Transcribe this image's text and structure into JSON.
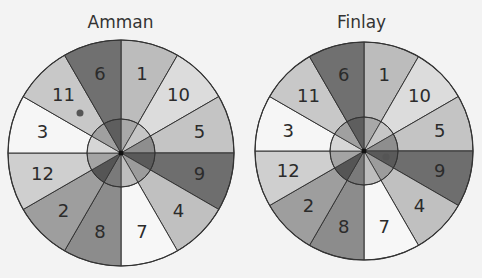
{
  "spinners": [
    {
      "name": "Amman",
      "center": [
        121,
        153
      ],
      "radius": 113,
      "inner_radius": 34,
      "dot": {
        "sector": "11",
        "x": 80,
        "y": 113
      }
    },
    {
      "name": "Finlay",
      "center": [
        364,
        151
      ],
      "radius": 109,
      "inner_radius": 34,
      "dot": {
        "sector": "9",
        "x": 386,
        "y": 157
      }
    }
  ],
  "sectors_clockwise_from_top": [
    {
      "label": "1",
      "color": "#bcbcbc",
      "inner": "#a8a8a8"
    },
    {
      "label": "10",
      "color": "#dcdcdc",
      "inner": "#c6c6c6"
    },
    {
      "label": "5",
      "color": "#c4c4c4",
      "inner": "#8e8e8e"
    },
    {
      "label": "9",
      "color": "#6e6e6e",
      "inner": "#5a5a5a"
    },
    {
      "label": "4",
      "color": "#c0c0c0",
      "inner": "#9c9c9c"
    },
    {
      "label": "7",
      "color": "#f7f7f7",
      "inner": "#bebebe"
    },
    {
      "label": "8",
      "color": "#8c8c8c",
      "inner": "#7a7a7a"
    },
    {
      "label": "2",
      "color": "#9e9e9e",
      "inner": "#555555"
    },
    {
      "label": "12",
      "color": "#cfcfcf",
      "inner": "#a4a4a4"
    },
    {
      "label": "3",
      "color": "#f6f6f6",
      "inner": "#d6d6d6"
    },
    {
      "label": "11",
      "color": "#c8c8c8",
      "inner": "#a0a0a0"
    },
    {
      "label": "6",
      "color": "#707070",
      "inner": "#5e5e5e"
    }
  ],
  "colors": {
    "outline": "#333333",
    "dot": "#555555",
    "background": "#f3f3f3"
  }
}
